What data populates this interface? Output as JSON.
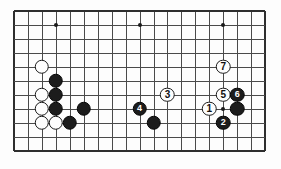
{
  "board": {
    "name": "go-board-diagram",
    "type": "go-problem-diagram",
    "columns": 19,
    "rows": 11,
    "origin_x": 14,
    "origin_y": 11,
    "spacing": 13.95,
    "line_color": "#4a4a4a",
    "edge_color": "#2e2e2e",
    "background_color": "#fdfdfd",
    "black_color": "#1c1c1c",
    "white_color": "#fdfdfd",
    "star_points": [
      {
        "col": 3,
        "row": 1
      },
      {
        "col": 9,
        "row": 1
      },
      {
        "col": 15,
        "row": 1
      },
      {
        "col": 15,
        "row": 7
      }
    ],
    "stones": [
      {
        "col": 2,
        "row": 4,
        "color": "white",
        "label": ""
      },
      {
        "col": 3,
        "row": 5,
        "color": "black",
        "label": ""
      },
      {
        "col": 2,
        "row": 6,
        "color": "white",
        "label": ""
      },
      {
        "col": 3,
        "row": 6,
        "color": "black",
        "label": ""
      },
      {
        "col": 2,
        "row": 7,
        "color": "white",
        "label": ""
      },
      {
        "col": 3,
        "row": 7,
        "color": "black",
        "label": ""
      },
      {
        "col": 5,
        "row": 7,
        "color": "black",
        "label": ""
      },
      {
        "col": 2,
        "row": 8,
        "color": "white",
        "label": ""
      },
      {
        "col": 3,
        "row": 8,
        "color": "white",
        "label": ""
      },
      {
        "col": 4,
        "row": 8,
        "color": "black",
        "label": ""
      },
      {
        "col": 9,
        "row": 7,
        "color": "black",
        "label": "4"
      },
      {
        "col": 10,
        "row": 8,
        "color": "black",
        "label": ""
      },
      {
        "col": 11,
        "row": 6,
        "color": "white",
        "label": "3"
      },
      {
        "col": 14,
        "row": 7,
        "color": "white",
        "label": "1"
      },
      {
        "col": 15,
        "row": 8,
        "color": "black",
        "label": "2"
      },
      {
        "col": 15,
        "row": 6,
        "color": "white",
        "label": "5"
      },
      {
        "col": 16,
        "row": 6,
        "color": "black",
        "label": "6"
      },
      {
        "col": 16,
        "row": 7,
        "color": "black",
        "label": ""
      },
      {
        "col": 15,
        "row": 4,
        "color": "white",
        "label": "7"
      }
    ],
    "move_sequence": [
      "1",
      "2",
      "3",
      "4",
      "5",
      "6",
      "7"
    ]
  }
}
